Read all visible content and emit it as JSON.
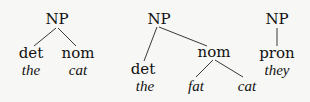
{
  "trees": [
    {
      "root": "NP",
      "children": [
        {
          "label": "det",
          "word": "the"
        },
        {
          "label": "nom",
          "word": "cat"
        }
      ]
    },
    {
      "root": "NP",
      "children": [
        {
          "label": "det",
          "word": "the"
        },
        {
          "label": "nom",
          "children": [
            {
              "word": "fat"
            },
            {
              "word": "cat"
            }
          ]
        }
      ]
    },
    {
      "root": "NP",
      "children": [
        {
          "label": "pron",
          "word": "they"
        }
      ]
    }
  ]
}
